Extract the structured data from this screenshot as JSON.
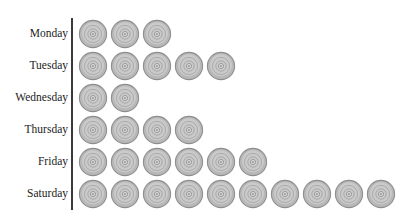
{
  "chart_data": {
    "type": "bar",
    "subtype": "pictogram",
    "title": "",
    "subtitle": "",
    "xlabel": "",
    "ylabel": "",
    "categories": [
      "Monday",
      "Tuesday",
      "Wednesday",
      "Thursday",
      "Friday",
      "Saturday"
    ],
    "values": [
      3,
      5,
      2,
      4,
      6,
      10
    ],
    "orientation": "horizontal",
    "icon_unit_value": 1,
    "icon_symbol": "disc-icon",
    "grid": false,
    "legend": null,
    "xlim": [
      0,
      10
    ],
    "axis_visible": true,
    "tick_labels": [],
    "annotations": [],
    "colors": {
      "icon_fill": "#b8b8b8",
      "icon_stroke": "#8e8e8e",
      "icon_highlight": "#d8d8d8",
      "axis": "#3a3a3a",
      "label_text": "#1c1c1c",
      "background": "#ffffff"
    }
  },
  "rows": [
    {
      "label": "Monday",
      "count": 3
    },
    {
      "label": "Tuesday",
      "count": 5
    },
    {
      "label": "Wednesday",
      "count": 2
    },
    {
      "label": "Thursday",
      "count": 4
    },
    {
      "label": "Friday",
      "count": 6
    },
    {
      "label": "Saturday",
      "count": 10
    }
  ]
}
